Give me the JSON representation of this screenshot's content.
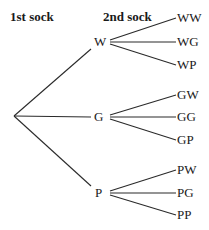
{
  "headers": {
    "first": "1st sock",
    "second": "2nd sock"
  },
  "tree": {
    "first_level": [
      {
        "label": "W",
        "children": [
          "WW",
          "WG",
          "WP"
        ]
      },
      {
        "label": "G",
        "children": [
          "GW",
          "GG",
          "GP"
        ]
      },
      {
        "label": "P",
        "children": [
          "PW",
          "PG",
          "PP"
        ]
      }
    ]
  }
}
